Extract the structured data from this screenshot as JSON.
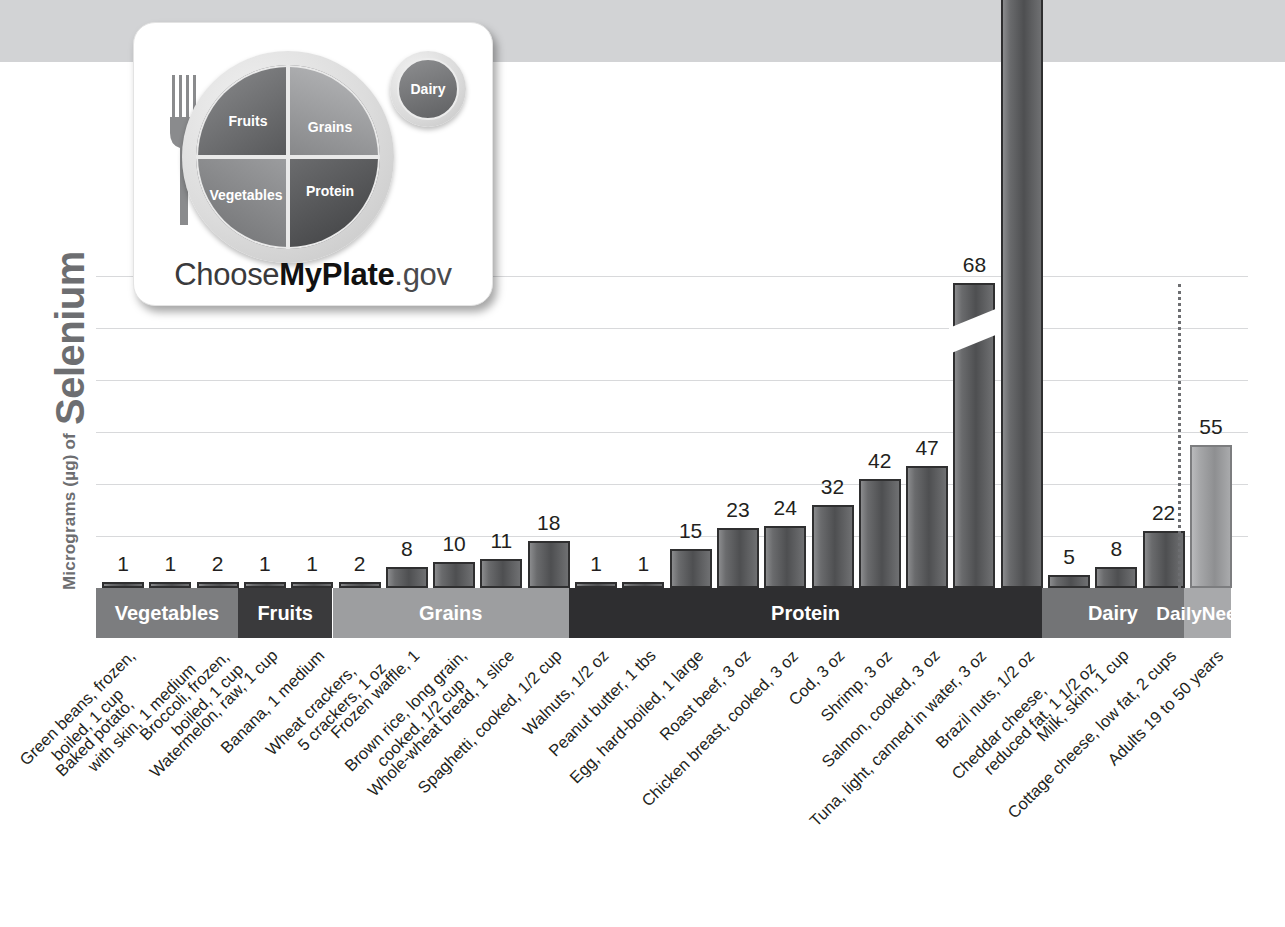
{
  "axis": {
    "y_title_prefix": "Micrograms (µg) of",
    "y_title_nutrient": "Selenium"
  },
  "logo": {
    "fruits": "Fruits",
    "grains": "Grains",
    "vegetables": "Vegetables",
    "protein": "Protein",
    "dairy": "Dairy",
    "wordmark_1": "Choose",
    "wordmark_2": "MyPlate",
    "wordmark_3": ".gov"
  },
  "groups": [
    {
      "name": "Vegetables",
      "color": "#7c7d7f"
    },
    {
      "name": "Fruits",
      "color": "#3a3a3c"
    },
    {
      "name": "Grains",
      "color": "#9d9ea0"
    },
    {
      "name": "Protein",
      "color": "#2e2e30"
    },
    {
      "name": "Dairy",
      "color": "#737476"
    },
    {
      "name": "Daily\nNeeds",
      "color": "#a8a9ab"
    }
  ],
  "chart_data": {
    "type": "bar",
    "xlabel": "",
    "ylabel": "Micrograms (µg) of Selenium",
    "ylim": [
      0,
      130
    ],
    "grid": true,
    "gridline_step": 20,
    "axis_break": {
      "bar_index": 18,
      "note": "bar truncated with diagonal break"
    },
    "units": "µg",
    "legend": "none",
    "categories": [
      "Green beans, frozen, boiled, 1 cup",
      "Baked potato, with skin, 1 medium",
      "Broccoli, frozen, boiled, 1 cup",
      "Watermelon, raw, 1 cup",
      "Banana, 1 medium",
      "Wheat crackers, 5 crackers, 1 oz",
      "Frozen waffle, 1",
      "Brown rice, long grain, cooked, 1/2 cup",
      "Whole-wheat bread, 1 slice",
      "Spaghetti, cooked, 1/2 cup",
      "Walnuts, 1/2 oz",
      "Peanut butter, 1 tbs",
      "Egg, hard-boiled, 1 large",
      "Roast beef, 3 oz",
      "Chicken breast, cooked, 3 oz",
      "Cod, 3 oz",
      "Shrimp, 3 oz",
      "Salmon, cooked, 3 oz",
      "Tuna, light, canned in water, 3 oz",
      "Brazil nuts, 1/2 oz",
      "Cheddar cheese, reduced fat, 1 1/2 oz",
      "Milk, skim, 1 cup",
      "Cottage cheese, low fat, 2 cups",
      "Adults 19 to 50 years"
    ],
    "values": [
      1,
      1,
      2,
      1,
      1,
      2,
      8,
      10,
      11,
      18,
      1,
      1,
      15,
      23,
      24,
      32,
      42,
      47,
      68,
      544,
      5,
      8,
      22,
      55
    ],
    "group_of": [
      "Vegetables",
      "Vegetables",
      "Vegetables",
      "Fruits",
      "Fruits",
      "Grains",
      "Grains",
      "Grains",
      "Grains",
      "Grains",
      "Protein",
      "Protein",
      "Protein",
      "Protein",
      "Protein",
      "Protein",
      "Protein",
      "Protein",
      "Protein",
      "Protein",
      "Dairy",
      "Dairy",
      "Dairy",
      "Daily Needs"
    ]
  },
  "labels": [
    {
      "l1": "Green beans, frozen,",
      "l2": "boiled, 1 cup"
    },
    {
      "l1": "Baked potato,",
      "l2": "with skin, 1 medium"
    },
    {
      "l1": "Broccoli, frozen,",
      "l2": "boiled, 1 cup"
    },
    {
      "l1": "Watermelon, raw, 1 cup",
      "l2": ""
    },
    {
      "l1": "Banana, 1 medium",
      "l2": ""
    },
    {
      "l1": "Wheat crackers,",
      "l2": "5 crackers, 1 oz"
    },
    {
      "l1": "Frozen waffle, 1",
      "l2": ""
    },
    {
      "l1": "Brown rice, long grain,",
      "l2": "cooked, 1/2 cup"
    },
    {
      "l1": "Whole-wheat bread, 1 slice",
      "l2": ""
    },
    {
      "l1": "Spaghetti, cooked, 1/2 cup",
      "l2": ""
    },
    {
      "l1": "Walnuts, 1/2 oz",
      "l2": ""
    },
    {
      "l1": "Peanut butter, 1 tbs",
      "l2": ""
    },
    {
      "l1": "Egg, hard-boiled, 1 large",
      "l2": ""
    },
    {
      "l1": "Roast beef, 3 oz",
      "l2": ""
    },
    {
      "l1": "Chicken breast, cooked, 3 oz",
      "l2": ""
    },
    {
      "l1": "Cod, 3 oz",
      "l2": ""
    },
    {
      "l1": "Shrimp, 3 oz",
      "l2": ""
    },
    {
      "l1": "Salmon, cooked, 3 oz",
      "l2": ""
    },
    {
      "l1": "Tuna, light, canned in water, 3 oz",
      "l2": ""
    },
    {
      "l1": "Brazil nuts, 1/2 oz",
      "l2": ""
    },
    {
      "l1": "Cheddar cheese,",
      "l2": "reduced fat, 1 1/2 oz"
    },
    {
      "l1": "Milk, skim, 1 cup",
      "l2": ""
    },
    {
      "l1": "Cottage cheese, low fat, 2 cups",
      "l2": ""
    },
    {
      "l1": "Adults 19 to 50 years",
      "l2": ""
    }
  ]
}
